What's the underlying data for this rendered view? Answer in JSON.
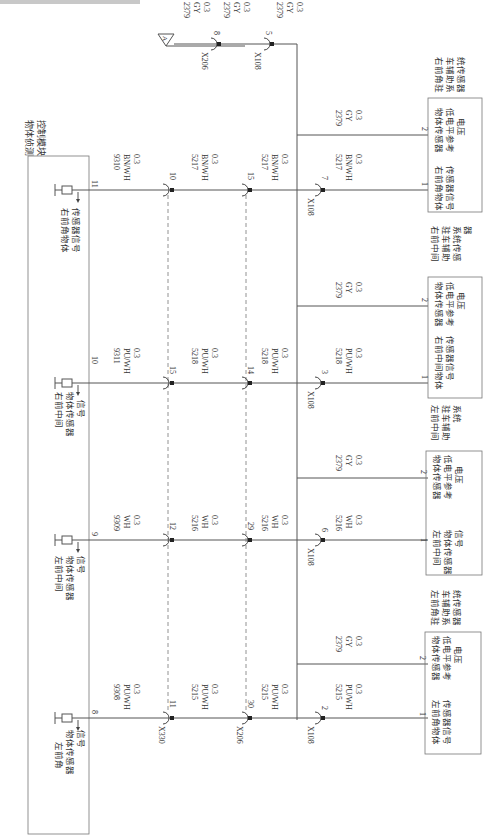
{
  "module": {
    "title_line1": "物体侦测",
    "title_line2": "控制模块",
    "pins": [
      {
        "pin": "11",
        "label_line1": "右前角物体",
        "label_line2": "传感器信号",
        "label_line3": ""
      },
      {
        "pin": "10",
        "label_line1": "右前中间",
        "label_line2": "物体传感器",
        "label_line3": "信号"
      },
      {
        "pin": "9",
        "label_line1": "左前中间",
        "label_line2": "物体传感器",
        "label_line3": "信号"
      },
      {
        "pin": "8",
        "label_line1": "左前角",
        "label_line2": "物体传感器",
        "label_line3": "信号"
      }
    ]
  },
  "wires": {
    "row1": {
      "seg1": {
        "circuit": "9310",
        "color": "BN/WH",
        "size": "0.3"
      },
      "c1": {
        "connector": "",
        "pin": "10"
      },
      "seg2": {
        "circuit": "5217",
        "color": "BN/WH",
        "size": "0.3"
      },
      "c2": {
        "connector": "",
        "pin": "15"
      },
      "seg3": {
        "circuit": "5217",
        "color": "BN/WH",
        "size": "0.3"
      },
      "c3": {
        "connector": "X108",
        "pin": "7"
      },
      "seg4": {
        "circuit": "5217",
        "color": "BN/WH",
        "size": "0.3"
      }
    },
    "row2": {
      "seg1": {
        "circuit": "9311",
        "color": "PU/WH",
        "size": "0.3"
      },
      "c1": {
        "connector": "",
        "pin": "15"
      },
      "seg2": {
        "circuit": "5218",
        "color": "PU/WH",
        "size": "0.3"
      },
      "c2": {
        "connector": "",
        "pin": "14"
      },
      "seg3": {
        "circuit": "5218",
        "color": "PU/WH",
        "size": "0.3"
      },
      "c3": {
        "connector": "X108",
        "pin": "3"
      },
      "seg4": {
        "circuit": "5218",
        "color": "PU/WH",
        "size": "0.3"
      }
    },
    "row3": {
      "seg1": {
        "circuit": "9309",
        "color": "WH",
        "size": "0.3"
      },
      "c1": {
        "connector": "",
        "pin": "12"
      },
      "seg2": {
        "circuit": "5216",
        "color": "WH",
        "size": "0.3"
      },
      "c2": {
        "connector": "",
        "pin": "29"
      },
      "seg3": {
        "circuit": "5216",
        "color": "WH",
        "size": "0.3"
      },
      "c3": {
        "connector": "X108",
        "pin": "6"
      },
      "seg4": {
        "circuit": "5216",
        "color": "WH",
        "size": "0.3"
      }
    },
    "row4": {
      "seg1": {
        "circuit": "9308",
        "color": "PU/WH",
        "size": "0.3"
      },
      "c1": {
        "connector": "X330",
        "pin": "11"
      },
      "seg2": {
        "circuit": "5215",
        "color": "PU/WH",
        "size": "0.3"
      },
      "c2": {
        "connector": "X206",
        "pin": "30"
      },
      "seg3": {
        "circuit": "5215",
        "color": "PU/WH",
        "size": "0.3"
      },
      "c3": {
        "connector": "X108",
        "pin": "2"
      },
      "seg4": {
        "circuit": "5215",
        "color": "PU/WH",
        "size": "0.3"
      }
    },
    "ground": {
      "ref": "A",
      "seg1": {
        "circuit": "2379",
        "color": "GY",
        "size": "0.3"
      },
      "c1": {
        "connector": "X206",
        "pin": "8"
      },
      "seg2": {
        "circuit": "2379",
        "color": "GY",
        "size": "0.3"
      },
      "c2": {
        "connector": "X108",
        "pin": "5"
      },
      "seg3": {
        "circuit": "2379",
        "color": "GY",
        "size": "0.3"
      },
      "branch": {
        "circuit": "2379",
        "color": "GY",
        "size": "0.3"
      }
    }
  },
  "sensors": [
    {
      "name_line1": "右前角驻",
      "name_line2": "车辅助系",
      "name_line3": "统传感器",
      "pin1": "1",
      "pin1_l1": "右前角物体",
      "pin1_l2": "传感器信号",
      "pin1_l3": "",
      "pin2": "2",
      "pin2_l1": "物体传感器",
      "pin2_l2": "低电平参考",
      "pin2_l3": "电压"
    },
    {
      "name_line1": "右前中间",
      "name_line2": "驻车辅助",
      "name_line3": "系统传感",
      "name_line4": "器",
      "pin1": "1",
      "pin1_l1": "右前中间物体",
      "pin1_l2": "传感器信号",
      "pin1_l3": "",
      "pin2": "2",
      "pin2_l1": "物体传感器",
      "pin2_l2": "低电平参考",
      "pin2_l3": "电压"
    },
    {
      "name_line1": "左前中间",
      "name_line2": "驻车辅助",
      "name_line3": "系统",
      "pin1": "1",
      "pin1_l1": "左前中间",
      "pin1_l2": "物体传感器",
      "pin1_l3": "信号",
      "pin2": "2",
      "pin2_l1": "物体传感器",
      "pin2_l2": "低电平参考",
      "pin2_l3": "电压"
    },
    {
      "name_line1": "左前角驻",
      "name_line2": "车辅助系",
      "name_line3": "统传感器",
      "pin1": "1",
      "pin1_l1": "左前角物体",
      "pin1_l2": "传感器信号",
      "pin1_l3": "",
      "pin2": "2",
      "pin2_l1": "物体传感器",
      "pin2_l2": "低电平参考",
      "pin2_l3": "电压"
    }
  ]
}
